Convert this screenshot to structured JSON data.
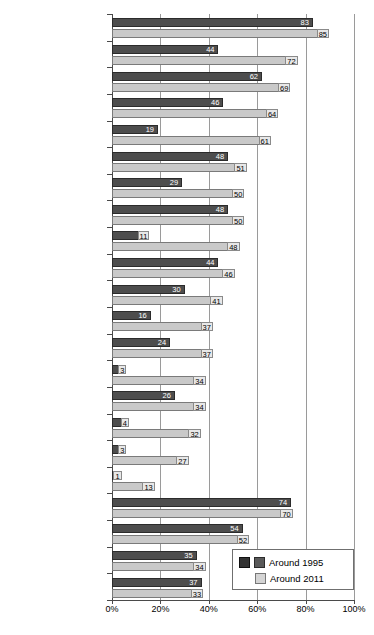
{
  "chart_data": {
    "type": "bar",
    "orientation": "horizontal",
    "title": "",
    "xlabel": "",
    "ylabel": "",
    "xlim": [
      0,
      100
    ],
    "xticks": [
      0,
      20,
      40,
      60,
      80,
      100
    ],
    "xticklabels": [
      "0%",
      "20%",
      "40%",
      "60%",
      "80%",
      "100%"
    ],
    "grid": true,
    "legend_position": "lower-right",
    "legend": [
      "Around 1995",
      "Around 2011"
    ],
    "series": [
      {
        "name": "Around 1995",
        "color": "#4d4d4d",
        "values": [
          83,
          44,
          62,
          46,
          19,
          48,
          29,
          48,
          11,
          44,
          30,
          16,
          24,
          3,
          26,
          4,
          3,
          1,
          74,
          54,
          35,
          37
        ]
      },
      {
        "name": "Around 2011",
        "color": "#c9c9c9",
        "values": [
          85,
          72,
          69,
          64,
          61,
          51,
          50,
          50,
          48,
          46,
          41,
          37,
          37,
          34,
          34,
          32,
          27,
          13,
          70,
          52,
          34,
          33
        ]
      }
    ],
    "categories": [
      {
        "country": "Rwanda",
        "years": "(1992, 2010)"
      },
      {
        "country": "Malawi",
        "years": "(2000, 2010)"
      },
      {
        "country": "Burundi",
        "years": "(2000, 2010)"
      },
      {
        "country": "Bangladesh",
        "years": "(1994, 2011)"
      },
      {
        "country": "Zambia",
        "years": "(1996, 2007)"
      },
      {
        "country": "Madagascar",
        "years": "(1997, 2009)"
      },
      {
        "country": "United Republic of",
        "years": "Tanzania (1996, 2010)"
      },
      {
        "country": "Guatemala",
        "years": "(1995, 2009)"
      },
      {
        "country": "Guinea",
        "years": "(1999, 2008)"
      },
      {
        "country": "India",
        "years": "(1993, 2006)"
      },
      {
        "country": "Mozambique",
        "years": "(1997, 2011)"
      },
      {
        "country": "Pakistan",
        "years": "(1995, 2007)"
      },
      {
        "country": "Democratic Republic of",
        "years": "the Congo (1995, 2010)"
      },
      {
        "country": "Central African Republic",
        "years": "(1995, 2010)"
      },
      {
        "country": "Philippines",
        "years": "(1993, 2008)"
      },
      {
        "country": "Sierra Leone",
        "years": "(2000, 2010)"
      },
      {
        "country": "Niger",
        "years": "(1992, 2010)"
      },
      {
        "country": "Nigeria",
        "years": "(1990, 2008)"
      },
      {
        "country": "Nepal",
        "years": "(1996, 2011)"
      },
      {
        "country": "Ethiopia",
        "years": "(2000, 2011)"
      },
      {
        "country": "Liberia",
        "years": "(1999, 2010)"
      },
      {
        "country": "Indonesia",
        "years": "(1994, 2007)"
      }
    ],
    "data_labels": {
      "series1": [
        "83",
        "44",
        "62",
        "46",
        "19",
        "48",
        "29",
        "48",
        "11",
        "44",
        "30",
        "16",
        "24",
        "3",
        "26",
        "4",
        "3",
        "1",
        "74",
        "54",
        "35",
        "37"
      ],
      "series2": [
        "85",
        "72",
        "69",
        "64",
        "61",
        "51",
        "50",
        "50",
        "48",
        "46",
        "41",
        "37",
        "37",
        "34",
        "34",
        "32",
        "27",
        "13",
        "70",
        "52",
        "34",
        "33"
      ]
    }
  }
}
